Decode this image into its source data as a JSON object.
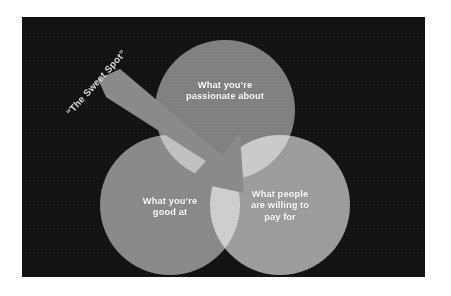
{
  "slide": {
    "background_color": "#ffffff",
    "panel_color": "#121212"
  },
  "diagram": {
    "type": "venn-three-circle",
    "name": "sweet-spot-venn-diagram",
    "caption": "“The Sweet Spot”",
    "arrow": {
      "name": "sweet-spot-arrow",
      "color": "#8a8a8a",
      "direction": "down-right",
      "points_to": "center-intersection"
    },
    "circles": [
      {
        "id": "passionate",
        "label": "What you’re\npassionate about",
        "line1": "What you’re",
        "line2": "passionate about",
        "color": "#a8a8a8",
        "position": "top"
      },
      {
        "id": "goodat",
        "label": "What you’re\ngood at",
        "line1": "What you’re",
        "line2": "good at",
        "color": "#b4b4b4",
        "position": "bottom-left"
      },
      {
        "id": "payfor",
        "label": "What people\nare willing to\npay for",
        "line1": "What people",
        "line2": "are willing to",
        "line3": "pay for",
        "color": "#cdcdcd",
        "position": "bottom-right"
      }
    ],
    "label_color": "#ffffff",
    "caption_color": "#d9d9d9"
  }
}
